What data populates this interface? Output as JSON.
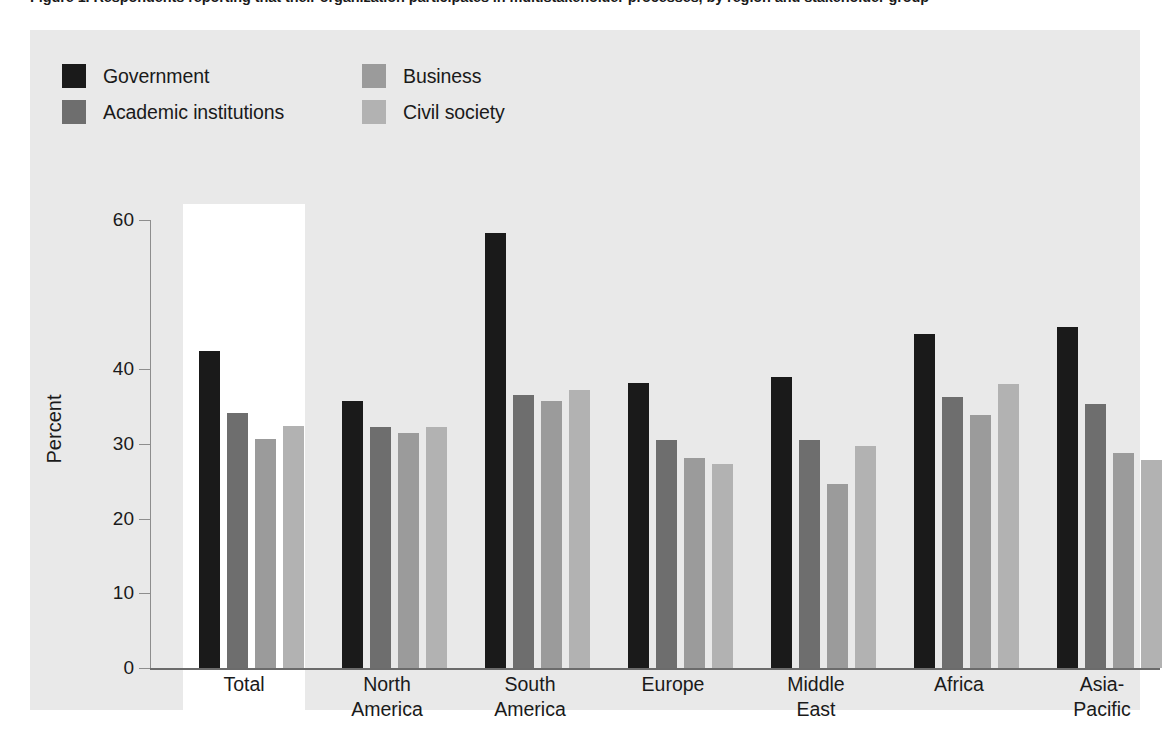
{
  "figure": {
    "caption": "Figure 1. Respondents reporting that their organization participates in multistakeholder processes, by region and stakeholder group"
  },
  "legend": {
    "items": [
      {
        "label": "Government",
        "color": "#1a1a1a"
      },
      {
        "label": "Business",
        "color": "#9b9b9b"
      },
      {
        "label": "Academic institutions",
        "color": "#6e6e6e"
      },
      {
        "label": "Civil society",
        "color": "#b2b2b2"
      }
    ]
  },
  "axes": {
    "y_title": "Percent",
    "y_ticks": [
      "60",
      "40",
      "30",
      "20",
      "10",
      "0"
    ],
    "y_tick_values": [
      60,
      40,
      30,
      20,
      10,
      0
    ],
    "y_min": 0,
    "y_max": 60
  },
  "highlight_group": "Total",
  "chart_data": {
    "type": "bar",
    "title": "",
    "xlabel": "",
    "ylabel": "Percent",
    "ylim": [
      0,
      60
    ],
    "grid": false,
    "legend_position": "top-left",
    "categories": [
      "Total",
      "North\nAmerica",
      "South\nAmerica",
      "Europe",
      "Middle\nEast",
      "Africa",
      "Asia-\nPacific"
    ],
    "series": [
      {
        "name": "Government",
        "color": "#1a1a1a",
        "values": [
          42.5,
          35.7,
          58.2,
          38.2,
          39.0,
          44.8,
          45.7
        ]
      },
      {
        "name": "Academic institutions",
        "color": "#6e6e6e",
        "values": [
          34.1,
          32.3,
          36.5,
          30.6,
          30.6,
          36.3,
          35.4
        ]
      },
      {
        "name": "Business",
        "color": "#9b9b9b",
        "values": [
          30.7,
          31.5,
          35.7,
          28.1,
          24.7,
          33.9,
          28.8
        ]
      },
      {
        "name": "Civil society",
        "color": "#b2b2b2",
        "values": [
          32.4,
          32.3,
          37.3,
          27.3,
          29.7,
          38.0,
          27.9
        ]
      }
    ]
  }
}
